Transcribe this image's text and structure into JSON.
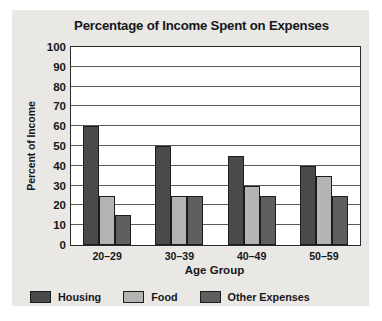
{
  "chart_data": {
    "type": "bar",
    "title": "Percentage of Income Spent on Expenses",
    "xlabel": "Age Group",
    "ylabel": "Percent of Income",
    "categories": [
      "20–29",
      "30–39",
      "40–49",
      "50–59"
    ],
    "series": [
      {
        "name": "Housing",
        "values": [
          60,
          50,
          45,
          40
        ],
        "color": "#4a4a4a"
      },
      {
        "name": "Food",
        "values": [
          25,
          25,
          30,
          35
        ],
        "color": "#b4b4b2"
      },
      {
        "name": "Other Expenses",
        "values": [
          15,
          25,
          25,
          25
        ],
        "color": "#5f5f5f"
      }
    ],
    "ylim": [
      0,
      100
    ],
    "yticks": [
      0,
      10,
      20,
      30,
      40,
      50,
      60,
      70,
      80,
      90,
      100
    ],
    "ytick_labels": [
      "0",
      "10",
      "20",
      "30",
      "40",
      "50",
      "60",
      "70",
      "80",
      "90",
      "100"
    ],
    "grid": true,
    "legend_position": "bottom-left",
    "background_color": "#e9e8e5",
    "plot_background_color": "#ffffff",
    "axis_color": "#2a2a2a"
  }
}
